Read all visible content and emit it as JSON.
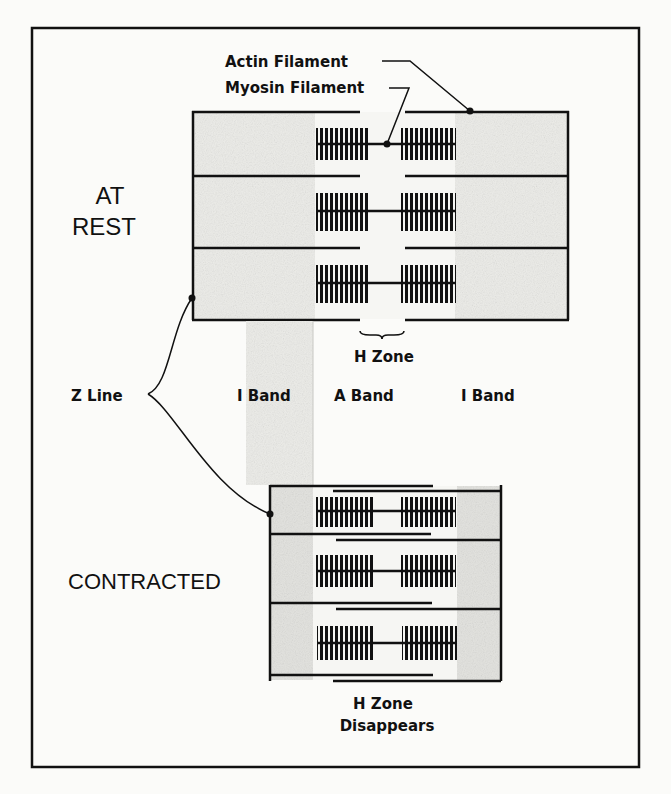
{
  "figure": {
    "colors": {
      "ink": "#111111",
      "paper": "#fbfbf9",
      "shade": "#e4e4e0"
    }
  },
  "labels": {
    "actin_filament": "Actin Filament",
    "myosin_filament": "Myosin Filament",
    "at_rest_line1": "AT",
    "at_rest_line2": "REST",
    "h_zone": "H Zone",
    "z_line": "Z Line",
    "i_band_left": "I Band",
    "a_band": "A Band",
    "i_band_right": "I Band",
    "contracted": "CONTRACTED",
    "h_zone_disappears_line1": "H Zone",
    "h_zone_disappears_line2": "Disappears"
  },
  "states": [
    {
      "name": "at-rest",
      "rows": 3,
      "h_zone_visible": true
    },
    {
      "name": "contracted",
      "rows": 3,
      "h_zone_visible": false
    }
  ]
}
